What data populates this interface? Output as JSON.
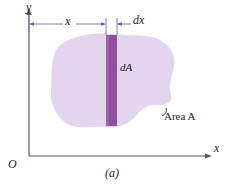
{
  "figure": {
    "caption": "(a)",
    "axes": {
      "y_label": "y",
      "x_label": "x",
      "origin_label": "O",
      "axis_color": "#555555"
    },
    "dimensions": [
      {
        "name": "x",
        "label": "x",
        "line_color": "#6b6fa8"
      },
      {
        "name": "dx",
        "label": "dx",
        "line_color": "#6b6fa8"
      }
    ],
    "annotations": [
      {
        "name": "dA",
        "label": "dA"
      },
      {
        "name": "area",
        "label": "Area A"
      }
    ],
    "colors": {
      "area_fill": "#e3d5ee",
      "strip_fill": "#8e4fa0",
      "strip_edge": "#6f3a80",
      "dimension_line": "#6b6fa8",
      "axis": "#555555",
      "leader": "#1a1a1a"
    }
  }
}
